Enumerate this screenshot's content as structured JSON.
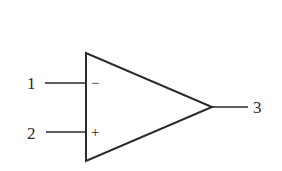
{
  "diagram": {
    "type": "op-amp-symbol",
    "colors": {
      "stroke": "#2a2a2a",
      "background": "#ffffff"
    },
    "pins": [
      {
        "id": "1",
        "label": "1",
        "sign": "−",
        "role": "inverting-input"
      },
      {
        "id": "2",
        "label": "2",
        "sign": "+",
        "role": "non-inverting-input"
      },
      {
        "id": "3",
        "label": "3",
        "role": "output"
      }
    ]
  }
}
